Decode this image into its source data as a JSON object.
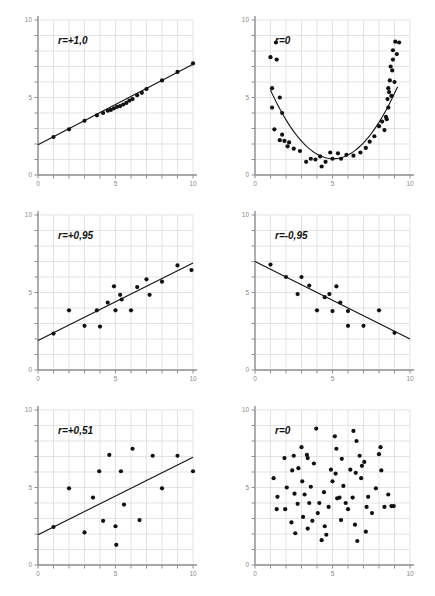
{
  "figure": {
    "title": "",
    "background": "#ffffff",
    "grid_color": "#d8d8dc",
    "axis_color": "#8f8f94",
    "tick_label_color": "#8a8a8a",
    "marker_color": "#111111",
    "line_color": "#111111",
    "panel_rows": 3,
    "panel_cols": 2
  },
  "axes": {
    "x_min": 0,
    "x_max": 10,
    "y_min": 0,
    "y_max": 10,
    "x_tick_step": 1,
    "y_tick_step": 1,
    "x_tick_labels": [
      "0",
      "5",
      "10"
    ],
    "y_tick_labels": [
      "10",
      "5",
      "0"
    ],
    "x_labeled_values": [
      0,
      5,
      10
    ],
    "y_labeled_values": [
      10,
      5,
      0
    ]
  },
  "chart_data": [
    {
      "type": "scatter",
      "panel": "top-left",
      "title": "",
      "annotation": "r=+1,0",
      "xlabel": "",
      "ylabel": "",
      "xlim": [
        0,
        10
      ],
      "ylim": [
        0,
        10
      ],
      "grid": true,
      "legend": "none",
      "fit_line": {
        "intercept": 1.95,
        "slope": 0.52,
        "x_from": 0,
        "x_to": 10
      },
      "points": [
        [
          1.0,
          2.45
        ],
        [
          2.0,
          2.95
        ],
        [
          3.0,
          3.5
        ],
        [
          3.8,
          3.85
        ],
        [
          4.2,
          4.0
        ],
        [
          4.5,
          4.15
        ],
        [
          4.7,
          4.2
        ],
        [
          4.9,
          4.3
        ],
        [
          5.1,
          4.4
        ],
        [
          5.3,
          4.45
        ],
        [
          5.5,
          4.55
        ],
        [
          5.7,
          4.65
        ],
        [
          5.9,
          4.8
        ],
        [
          6.1,
          4.9
        ],
        [
          6.4,
          5.15
        ],
        [
          6.7,
          5.3
        ],
        [
          7.0,
          5.55
        ],
        [
          8.0,
          6.1
        ],
        [
          9.0,
          6.65
        ],
        [
          10.0,
          7.2
        ]
      ]
    },
    {
      "type": "scatter",
      "panel": "top-right",
      "title": "",
      "annotation": "r=0",
      "xlabel": "",
      "ylabel": "",
      "xlim": [
        0,
        10
      ],
      "ylim": [
        0,
        10
      ],
      "grid": true,
      "legend": "none",
      "fit_curve": {
        "shape": "parabola",
        "vertex_x": 5.05,
        "vertex_y": 1.05,
        "a": 0.27,
        "x_from": 1.0,
        "x_to": 9.2
      },
      "points": [
        [
          1.0,
          7.6
        ],
        [
          1.35,
          8.55
        ],
        [
          1.4,
          7.45
        ],
        [
          1.1,
          5.6
        ],
        [
          1.1,
          4.35
        ],
        [
          1.25,
          2.95
        ],
        [
          1.6,
          5.0
        ],
        [
          1.75,
          4.0
        ],
        [
          1.75,
          2.6
        ],
        [
          1.6,
          2.25
        ],
        [
          1.9,
          2.2
        ],
        [
          2.1,
          1.85
        ],
        [
          2.2,
          2.1
        ],
        [
          2.5,
          1.7
        ],
        [
          2.9,
          1.55
        ],
        [
          3.3,
          0.85
        ],
        [
          3.6,
          1.05
        ],
        [
          3.9,
          1.0
        ],
        [
          4.2,
          1.2
        ],
        [
          4.3,
          0.55
        ],
        [
          4.55,
          0.85
        ],
        [
          4.85,
          1.45
        ],
        [
          5.0,
          1.05
        ],
        [
          5.35,
          1.4
        ],
        [
          5.55,
          1.05
        ],
        [
          5.9,
          1.3
        ],
        [
          6.35,
          1.25
        ],
        [
          6.8,
          1.45
        ],
        [
          7.15,
          1.75
        ],
        [
          7.4,
          2.15
        ],
        [
          7.7,
          2.5
        ],
        [
          8.0,
          3.15
        ],
        [
          8.2,
          3.45
        ],
        [
          8.35,
          2.9
        ],
        [
          8.45,
          3.75
        ],
        [
          8.5,
          3.6
        ],
        [
          8.6,
          4.35
        ],
        [
          8.65,
          5.35
        ],
        [
          8.6,
          5.6
        ],
        [
          8.7,
          6.1
        ],
        [
          8.8,
          5.1
        ],
        [
          8.85,
          6.75
        ],
        [
          8.75,
          7.0
        ],
        [
          8.9,
          7.45
        ],
        [
          8.9,
          8.05
        ],
        [
          9.0,
          6.0
        ],
        [
          9.05,
          8.6
        ],
        [
          9.15,
          7.8
        ],
        [
          9.3,
          8.55
        ],
        [
          8.55,
          4.9
        ]
      ]
    },
    {
      "type": "scatter",
      "panel": "middle-left",
      "title": "",
      "annotation": "r=+0,95",
      "xlabel": "",
      "ylabel": "",
      "xlim": [
        0,
        10
      ],
      "ylim": [
        0,
        10
      ],
      "grid": true,
      "legend": "none",
      "fit_line": {
        "intercept": 1.9,
        "slope": 0.5,
        "x_from": 0,
        "x_to": 10
      },
      "points": [
        [
          1.0,
          2.35
        ],
        [
          2.0,
          3.85
        ],
        [
          3.0,
          2.85
        ],
        [
          3.8,
          3.85
        ],
        [
          4.0,
          2.8
        ],
        [
          4.5,
          4.35
        ],
        [
          4.9,
          5.4
        ],
        [
          5.0,
          3.85
        ],
        [
          5.3,
          4.85
        ],
        [
          5.4,
          4.55
        ],
        [
          6.0,
          3.85
        ],
        [
          6.4,
          5.35
        ],
        [
          7.0,
          5.85
        ],
        [
          7.2,
          4.85
        ],
        [
          8.0,
          5.7
        ],
        [
          9.0,
          6.75
        ],
        [
          9.9,
          6.45
        ]
      ]
    },
    {
      "type": "scatter",
      "panel": "middle-right",
      "title": "",
      "annotation": "r=-0,95",
      "xlabel": "",
      "ylabel": "",
      "xlim": [
        0,
        10
      ],
      "ylim": [
        0,
        10
      ],
      "grid": true,
      "legend": "none",
      "fit_line": {
        "intercept": 7.0,
        "slope": -0.5,
        "x_from": 0,
        "x_to": 10
      },
      "points": [
        [
          1.0,
          6.8
        ],
        [
          2.0,
          6.0
        ],
        [
          2.75,
          4.9
        ],
        [
          3.0,
          6.0
        ],
        [
          3.5,
          5.45
        ],
        [
          4.0,
          3.85
        ],
        [
          4.5,
          4.7
        ],
        [
          4.8,
          4.9
        ],
        [
          5.0,
          3.8
        ],
        [
          5.25,
          5.4
        ],
        [
          5.5,
          4.35
        ],
        [
          6.0,
          3.8
        ],
        [
          6.0,
          2.85
        ],
        [
          7.0,
          2.85
        ],
        [
          8.0,
          3.85
        ],
        [
          9.0,
          2.4
        ]
      ]
    },
    {
      "type": "scatter",
      "panel": "bottom-left",
      "title": "",
      "annotation": "r=+0,51",
      "xlabel": "",
      "ylabel": "",
      "xlim": [
        0,
        10
      ],
      "ylim": [
        0,
        10
      ],
      "grid": true,
      "legend": "none",
      "fit_line": {
        "intercept": 1.95,
        "slope": 0.5,
        "x_from": 0,
        "x_to": 10
      },
      "points": [
        [
          1.0,
          2.45
        ],
        [
          2.0,
          4.95
        ],
        [
          3.0,
          2.1
        ],
        [
          3.55,
          4.35
        ],
        [
          3.95,
          6.05
        ],
        [
          4.2,
          2.85
        ],
        [
          4.6,
          7.1
        ],
        [
          5.0,
          2.5
        ],
        [
          5.05,
          1.3
        ],
        [
          5.35,
          6.05
        ],
        [
          5.55,
          3.9
        ],
        [
          6.1,
          7.5
        ],
        [
          6.55,
          2.9
        ],
        [
          7.4,
          7.05
        ],
        [
          8.0,
          4.95
        ],
        [
          9.0,
          7.05
        ],
        [
          10.0,
          6.05
        ]
      ]
    },
    {
      "type": "scatter",
      "panel": "bottom-right",
      "title": "",
      "annotation": "r=0",
      "xlabel": "",
      "ylabel": "",
      "xlim": [
        0,
        10
      ],
      "ylim": [
        0,
        10
      ],
      "grid": true,
      "legend": "none",
      "fit_line": null,
      "points": [
        [
          1.2,
          5.6
        ],
        [
          1.45,
          4.4
        ],
        [
          1.4,
          3.6
        ],
        [
          1.95,
          3.6
        ],
        [
          2.05,
          5.0
        ],
        [
          1.9,
          6.9
        ],
        [
          2.35,
          2.75
        ],
        [
          2.5,
          7.05
        ],
        [
          2.55,
          4.6
        ],
        [
          2.4,
          6.1
        ],
        [
          2.6,
          2.05
        ],
        [
          2.75,
          3.95
        ],
        [
          2.8,
          6.25
        ],
        [
          3.0,
          7.6
        ],
        [
          3.05,
          5.4
        ],
        [
          3.1,
          3.1
        ],
        [
          3.2,
          4.55
        ],
        [
          3.35,
          7.1
        ],
        [
          3.4,
          6.9
        ],
        [
          3.4,
          2.35
        ],
        [
          3.5,
          4.0
        ],
        [
          3.6,
          5.05
        ],
        [
          3.7,
          2.85
        ],
        [
          3.8,
          6.55
        ],
        [
          3.95,
          8.8
        ],
        [
          4.05,
          3.35
        ],
        [
          4.15,
          4.0
        ],
        [
          4.3,
          1.6
        ],
        [
          4.45,
          4.7
        ],
        [
          4.5,
          2.5
        ],
        [
          4.6,
          1.95
        ],
        [
          4.75,
          3.75
        ],
        [
          4.9,
          6.15
        ],
        [
          5.0,
          5.4
        ],
        [
          5.15,
          8.3
        ],
        [
          5.25,
          7.5
        ],
        [
          5.3,
          4.3
        ],
        [
          5.45,
          4.35
        ],
        [
          5.55,
          2.9
        ],
        [
          5.6,
          6.85
        ],
        [
          5.7,
          5.1
        ],
        [
          5.85,
          4.0
        ],
        [
          6.0,
          3.6
        ],
        [
          6.15,
          6.15
        ],
        [
          6.3,
          4.35
        ],
        [
          6.35,
          8.65
        ],
        [
          6.45,
          2.6
        ],
        [
          6.5,
          5.95
        ],
        [
          6.55,
          8.0
        ],
        [
          6.6,
          1.55
        ],
        [
          6.75,
          7.05
        ],
        [
          6.85,
          5.6
        ],
        [
          7.05,
          6.65
        ],
        [
          7.15,
          2.15
        ],
        [
          7.2,
          3.75
        ],
        [
          7.3,
          4.4
        ],
        [
          7.55,
          3.35
        ],
        [
          7.8,
          4.95
        ],
        [
          8.0,
          7.15
        ],
        [
          8.1,
          7.6
        ],
        [
          8.15,
          6.1
        ],
        [
          8.35,
          3.75
        ],
        [
          8.6,
          4.55
        ],
        [
          8.8,
          3.8
        ],
        [
          8.95,
          3.8
        ],
        [
          6.9,
          6.4
        ],
        [
          5.2,
          5.9
        ]
      ]
    }
  ]
}
